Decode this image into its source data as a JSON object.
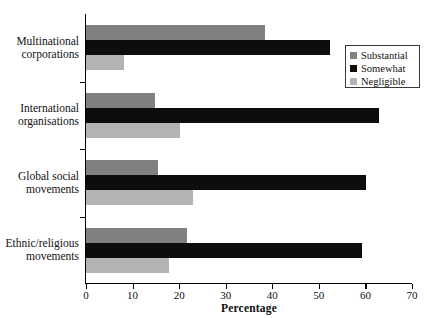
{
  "chart_data": {
    "type": "bar",
    "orientation": "horizontal",
    "title": "",
    "xlabel": "Percentage",
    "ylabel": "",
    "xlim": [
      0,
      70
    ],
    "xticks": [
      0,
      10,
      20,
      30,
      40,
      50,
      60,
      70
    ],
    "xtick_labels": [
      "0",
      "10",
      "20",
      "30",
      "40",
      "50",
      "60",
      "70"
    ],
    "grid": false,
    "legend_position": "upper right",
    "categories": [
      "Multinational\ncorporations",
      "International\norganisations",
      "Global social\nmovements",
      "Ethnic/religious\nmovements"
    ],
    "series": [
      {
        "name": "Substantial",
        "color": "#808080",
        "values": [
          38.4,
          14.8,
          15.5,
          21.7
        ]
      },
      {
        "name": "Somewhat",
        "color": "#0d0d0d",
        "values": [
          52.4,
          62.9,
          60.1,
          59.3
        ]
      },
      {
        "name": "Negligible",
        "color": "#b3b3b3",
        "values": [
          8.2,
          20.2,
          23.0,
          17.8
        ]
      }
    ]
  },
  "legend": {
    "items": [
      {
        "label": "Substantial",
        "color": "#808080"
      },
      {
        "label": "Somewhat",
        "color": "#0d0d0d"
      },
      {
        "label": "Negligible",
        "color": "#b3b3b3"
      }
    ]
  },
  "axis": {
    "x_title": "Percentage"
  }
}
